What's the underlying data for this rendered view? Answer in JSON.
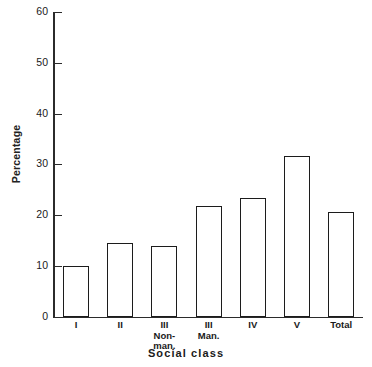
{
  "chart_data": {
    "type": "bar",
    "title": "",
    "xlabel": "Social class",
    "ylabel": "Percentage",
    "categories": [
      "I",
      "II",
      "III Non-man.",
      "III Man.",
      "IV",
      "V",
      "Total"
    ],
    "category_lines": [
      [
        "I"
      ],
      [
        "II"
      ],
      [
        "III",
        "Non-",
        "man."
      ],
      [
        "III",
        "Man."
      ],
      [
        "IV"
      ],
      [
        "V"
      ],
      [
        "Total"
      ]
    ],
    "values": [
      10.0,
      14.5,
      13.8,
      21.8,
      23.3,
      31.6,
      20.6
    ],
    "ylim": [
      0,
      60
    ],
    "yticks": [
      0,
      10,
      20,
      30,
      40,
      50,
      60
    ],
    "ytick_labels": [
      "0",
      "10",
      "20",
      "30",
      "40",
      "50",
      "60"
    ],
    "grid": false,
    "legend": null,
    "bar_fill": "#ffffff",
    "bar_edge": "#1c1c1c",
    "axis_color": "#2b2b2b",
    "background": "#ffffff"
  }
}
